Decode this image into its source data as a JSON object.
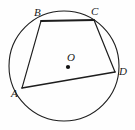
{
  "figure": {
    "type": "cyclic-quadrilateral-in-circle",
    "width": 135,
    "height": 130,
    "background_color": "#fefefe",
    "stroke_color": "#1d1d1d"
  },
  "circle": {
    "name": "circumscribed-circle",
    "center_x": 64,
    "center_y": 66,
    "radius": 55,
    "stroke_width": 1.1
  },
  "center_point": {
    "label": "O",
    "dot_x": 68,
    "dot_y": 67,
    "dot_radius": 2.1,
    "label_x": 67,
    "label_y": 52
  },
  "vertices": [
    {
      "label": "A",
      "x": 22,
      "y": 88,
      "label_x": 11,
      "label_y": 88
    },
    {
      "label": "B",
      "x": 41,
      "y": 21,
      "label_x": 34,
      "label_y": 7
    },
    {
      "label": "C",
      "x": 94,
      "y": 20,
      "label_x": 91,
      "label_y": 6
    },
    {
      "label": "D",
      "x": 115,
      "y": 72,
      "label_x": 119,
      "label_y": 66
    }
  ],
  "chords": [
    {
      "name": "chord-AB",
      "from": "A",
      "to": "B",
      "x1": 22,
      "y1": 88,
      "x2": 41,
      "y2": 21,
      "stroke_width": 1.1
    },
    {
      "name": "chord-BC",
      "from": "B",
      "to": "C",
      "x1": 41,
      "y1": 21,
      "x2": 94,
      "y2": 20,
      "stroke_width": 1.8
    },
    {
      "name": "chord-CD",
      "from": "C",
      "to": "D",
      "x1": 94,
      "y1": 20,
      "x2": 115,
      "y2": 72,
      "stroke_width": 1.2
    },
    {
      "name": "chord-AD",
      "from": "A",
      "to": "D",
      "x1": 22,
      "y1": 88,
      "x2": 115,
      "y2": 72,
      "stroke_width": 1.6
    }
  ]
}
